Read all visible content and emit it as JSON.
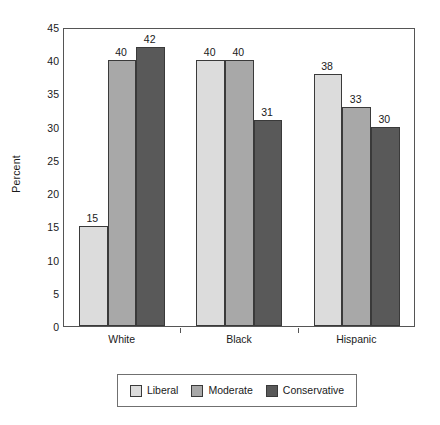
{
  "chart_data": {
    "type": "bar",
    "title": "",
    "subtitle": "",
    "xlabel": "",
    "ylabel": "Percent",
    "categories": [
      "White",
      "Black",
      "Hispanic"
    ],
    "series": [
      {
        "name": "Liberal",
        "color": "#dcdcdc",
        "values": [
          15,
          40,
          38
        ]
      },
      {
        "name": "Moderate",
        "color": "#a8a8a8",
        "values": [
          40,
          40,
          33
        ]
      },
      {
        "name": "Conservative",
        "color": "#595959",
        "values": [
          42,
          31,
          30
        ]
      }
    ],
    "ylim": [
      0,
      45
    ],
    "ytick_step": 5,
    "ytick_labels": [
      "0",
      "5",
      "10",
      "15",
      "20",
      "25",
      "30",
      "35",
      "40",
      "45"
    ],
    "grid": false,
    "data_labels": true,
    "legend_position": "bottom",
    "bar_orientation": "vertical",
    "grouping": "clustered"
  },
  "axes": {
    "y_title": "Percent",
    "y_ticks": [
      0,
      5,
      10,
      15,
      20,
      25,
      30,
      35,
      40,
      45
    ],
    "x_categories": [
      "White",
      "Black",
      "Hispanic"
    ]
  },
  "legend": {
    "items": [
      {
        "label": "Liberal",
        "color": "#dcdcdc"
      },
      {
        "label": "Moderate",
        "color": "#a8a8a8"
      },
      {
        "label": "Conservative",
        "color": "#595959"
      }
    ]
  }
}
